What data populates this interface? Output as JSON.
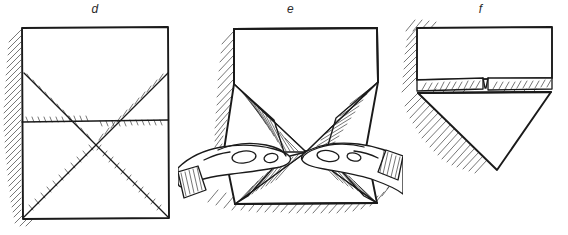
{
  "figure": {
    "style": "hand-drawn line art, black ink on white",
    "background_color": "#ffffff",
    "ink_color": "#1a1a1a",
    "width": 568,
    "height": 235,
    "panel_count": 3
  },
  "panels": [
    {
      "id": "d",
      "label": "d",
      "caption": "",
      "description": "Square sheet of paper seen flat, with both diagonals and a horizontal centre crease drawn as hatched fold lines; cast shadow hatching along the left edge.",
      "elements": [
        "square-sheet",
        "diagonal-crease-top-left-to-bottom-right",
        "diagonal-crease-bottom-left-to-top-right",
        "horizontal-centre-crease",
        "left-edge-shadow-hatching"
      ]
    },
    {
      "id": "e",
      "label": "e",
      "caption": "",
      "description": "Two hands collapsing the square inward along the creases; the side panels pleat into hatched triangular flaps meeting at the centre point.",
      "elements": [
        "collapsing-sheet",
        "left-hand",
        "right-hand",
        "hatched-fold-flaps",
        "ground-shadow-hatching"
      ]
    },
    {
      "id": "f",
      "label": "f",
      "caption": "",
      "description": "Resulting form: a rectangular top face with two small flaps folded down leaving a central notch, and a downward-pointing triangular tip beneath; shadow hatching on the left.",
      "elements": [
        "top-rectangular-face",
        "left-folded-flap",
        "right-folded-flap",
        "centre-notch",
        "lower-triangular-point",
        "left-shadow-hatching"
      ]
    }
  ],
  "colors": {
    "ink": "#1a1a1a",
    "paper": "#ffffff",
    "shadow": "#2b2b2b"
  }
}
